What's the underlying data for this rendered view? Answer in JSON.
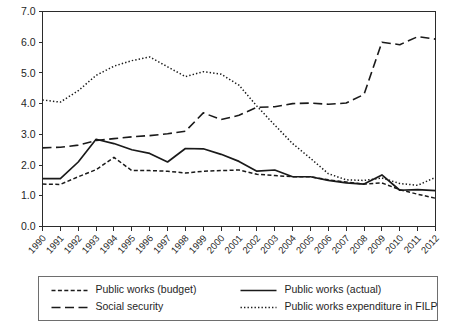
{
  "chart_data": {
    "type": "line",
    "title": "",
    "subtitle": "",
    "xlabel": "",
    "ylabel": "",
    "xlim": [
      1990,
      2012
    ],
    "ylim": [
      0.0,
      7.0
    ],
    "grid": false,
    "legend_position": "bottom",
    "x": [
      1990,
      1991,
      1992,
      1993,
      1994,
      1995,
      1996,
      1997,
      1998,
      1999,
      2000,
      2001,
      2002,
      2003,
      2004,
      2005,
      2006,
      2007,
      2008,
      2009,
      2010,
      2011,
      2012
    ],
    "categories": [
      "1990",
      "1991",
      "1992",
      "1993",
      "1994",
      "1995",
      "1996",
      "1997",
      "1998",
      "1999",
      "2000",
      "2001",
      "2002",
      "2003",
      "2004",
      "2005",
      "2006",
      "2007",
      "2008",
      "2009",
      "2010",
      "2011",
      "2012"
    ],
    "ytick_labels": [
      "0.0",
      "1.0",
      "2.0",
      "3.0",
      "4.0",
      "5.0",
      "6.0",
      "7.0"
    ],
    "ytick_values": [
      0.0,
      1.0,
      2.0,
      3.0,
      4.0,
      5.0,
      6.0,
      7.0
    ],
    "series": [
      {
        "name": "Public works (budget)",
        "style": "short-dash",
        "values": [
          1.38,
          1.37,
          1.62,
          1.85,
          2.25,
          1.82,
          1.82,
          1.8,
          1.74,
          1.8,
          1.82,
          1.84,
          1.7,
          1.66,
          1.62,
          1.62,
          1.52,
          1.45,
          1.38,
          1.42,
          1.2,
          1.05,
          0.92
        ]
      },
      {
        "name": "Public works (actual)",
        "style": "solid",
        "values": [
          1.56,
          1.56,
          2.1,
          2.84,
          2.7,
          2.5,
          2.38,
          2.1,
          2.54,
          2.53,
          2.35,
          2.12,
          1.8,
          1.84,
          1.62,
          1.62,
          1.5,
          1.42,
          1.38,
          1.68,
          1.18,
          1.2,
          1.17
        ]
      },
      {
        "name": "Social security",
        "style": "long-dash",
        "values": [
          2.56,
          2.58,
          2.65,
          2.8,
          2.86,
          2.92,
          2.96,
          3.02,
          3.1,
          3.7,
          3.48,
          3.62,
          3.88,
          3.9,
          4.0,
          4.02,
          3.98,
          4.02,
          4.3,
          6.0,
          5.92,
          6.18,
          6.1
        ]
      },
      {
        "name": "Public works expenditure in FILP",
        "style": "dotted",
        "values": [
          4.12,
          4.05,
          4.42,
          4.92,
          5.22,
          5.4,
          5.52,
          5.2,
          4.88,
          5.04,
          4.96,
          4.6,
          3.92,
          3.3,
          2.7,
          2.22,
          1.72,
          1.52,
          1.5,
          1.58,
          1.4,
          1.34,
          1.6
        ]
      }
    ]
  },
  "legend": {
    "entries": [
      {
        "label": "Public works (budget)",
        "style": "short-dash"
      },
      {
        "label": "Public works (actual)",
        "style": "solid"
      },
      {
        "label": "Social security",
        "style": "long-dash"
      },
      {
        "label": "Public works expenditure in FILP",
        "style": "dotted"
      }
    ]
  },
  "colors": {
    "line": "#1a1a1a",
    "axis": "#2b2b2b",
    "legend_border": "#6e6e6e",
    "background": "#ffffff"
  }
}
